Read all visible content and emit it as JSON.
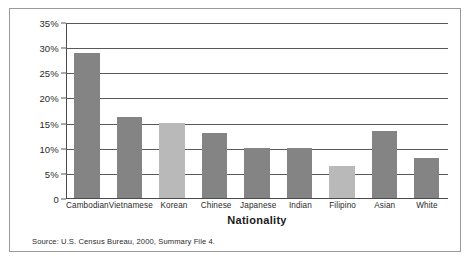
{
  "figure": {
    "source_note": "Source: U.S. Census Bureau, 2000, Summary File 4.",
    "border_color": "#9a9a9a"
  },
  "chart_data": {
    "type": "bar",
    "title": "",
    "xlabel": "Nationality",
    "ylabel": "",
    "categories": [
      "Cambodian",
      "Vietnamese",
      "Korean",
      "Chinese",
      "Japanese",
      "Indian",
      "Filipino",
      "Asian",
      "White"
    ],
    "values": [
      28.8,
      16.2,
      15.0,
      13.0,
      10.0,
      10.0,
      6.3,
      13.3,
      8.0
    ],
    "value_labels": [
      "28.8%",
      "16.2%",
      "15.0%",
      "13.0%",
      "10.0%",
      "10.0%",
      "6.3%",
      "13.3%",
      "8.0%"
    ],
    "bar_colors": [
      "#848484",
      "#848484",
      "#b9b9b9",
      "#848484",
      "#848484",
      "#848484",
      "#b9b9b9",
      "#848484",
      "#848484"
    ],
    "ylim": [
      0,
      35
    ],
    "yticks": [
      0,
      5,
      10,
      15,
      20,
      25,
      30,
      35
    ],
    "ytick_labels": [
      "0",
      "5%",
      "10%",
      "15%",
      "20%",
      "25%",
      "30%",
      "35%"
    ],
    "grid": true,
    "legend": null,
    "palette": {
      "bar_dark": "#848484",
      "bar_light": "#b9b9b9",
      "gridline": "#595959",
      "axis": "#4a4a4a"
    }
  }
}
